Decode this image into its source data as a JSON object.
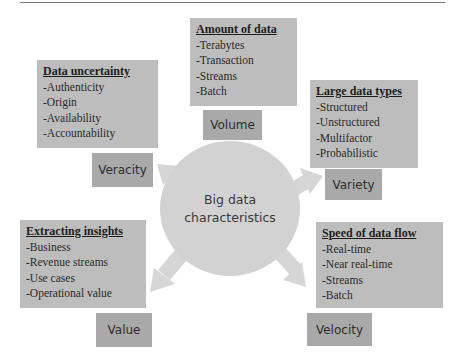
{
  "diagram": {
    "center": {
      "line1": "Big data",
      "line2": "characteristics"
    },
    "characteristics": [
      {
        "label": "Volume",
        "title": "Amount of data",
        "items": [
          "-Terabytes",
          "-Transaction",
          "-Streams",
          "-Batch"
        ]
      },
      {
        "label": "Veracity",
        "title": "Data uncertainty",
        "items": [
          "-Authenticity",
          "-Origin",
          "-Availability",
          "-Accountability"
        ]
      },
      {
        "label": "Variety",
        "title": "Large data types",
        "items": [
          "-Structured",
          "-Unstructured",
          "-Multifactor",
          "-Probabilistic"
        ]
      },
      {
        "label": "Value",
        "title": "Extracting insights",
        "items": [
          "-Business",
          "-Revenue streams",
          "-Use cases",
          "-Operational value"
        ]
      },
      {
        "label": "Velocity",
        "title": "Speed of data flow",
        "items": [
          "-Real-time",
          "-Near real-time",
          "-Streams",
          "-Batch"
        ]
      }
    ],
    "colors": {
      "info_box": "#bdbdbd",
      "label_box": "#a9a9a9",
      "circle": "#d2d2d2",
      "arrow": "#d6d6d6"
    }
  }
}
